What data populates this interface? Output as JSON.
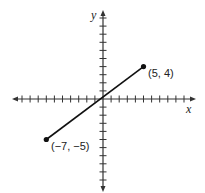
{
  "diagram": {
    "type": "coordinate-plane-segment",
    "axes": {
      "x_label": "x",
      "y_label": "y",
      "x_range": [
        -10,
        10
      ],
      "y_range": [
        -10,
        10
      ],
      "tick_step": 1
    },
    "segment": {
      "start": {
        "x": -7,
        "y": -5,
        "label": "(−7, −5)"
      },
      "end": {
        "x": 5,
        "y": 4,
        "label": "(5, 4)"
      }
    },
    "colors": {
      "line": "#111111",
      "axis": "#333333",
      "text": "#222222"
    }
  }
}
